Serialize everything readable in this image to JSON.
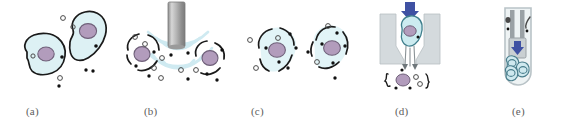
{
  "figure": {
    "background_color": "#ffffff",
    "width": 572,
    "height": 121
  },
  "palette": {
    "cytoplasm_fill": "#ddf1f4",
    "cytoplasm_fill_light": "#e8f6f8",
    "membrane_stroke": "#1a1a1a",
    "nucleus_fill": "#b29cbc",
    "nucleus_stroke": "#6f6079",
    "particle_dark": "#111111",
    "particle_open_stroke": "#4a4a4a",
    "wave_color": "#cfeaf1",
    "pipette_body": "#9a9a9a",
    "pipette_highlight": "#d8d8d8",
    "device_wall": "#c9cfd2",
    "device_wall_light": "#dfe4e6",
    "arrow_blue": "#3f51a3",
    "tube_outline": "#b9c3c7",
    "tube_fill": "#e9eef0",
    "label_color": "#5d5d5d"
  },
  "panels": [
    {
      "id": "a",
      "label": "(a)",
      "name": "panel-a-intact-cells",
      "description": "Two intact cells with membranes, nuclei and a few free particles around them",
      "cell_count": 2,
      "free_particle_count": 6
    },
    {
      "id": "b",
      "label": "(b)",
      "name": "panel-b-ultrasound-lysis",
      "description": "Ultrasonic probe emitting wave arcs that disrupt two cells releasing contents",
      "cell_count": 2,
      "has_probe": true,
      "wave_arc_count": 6
    },
    {
      "id": "c",
      "label": "(c)",
      "name": "panel-c-permeabilized-cells",
      "description": "Two cells with broken discontinuous membranes and particles leaking out",
      "cell_count": 2,
      "free_particle_count": 8
    },
    {
      "id": "d",
      "label": "(d)",
      "name": "panel-d-cell-capture-funnel",
      "description": "Cell pressed by a blue arrow into a funnel trap; contents stream out below",
      "cell_count": 1,
      "has_arrow": true
    },
    {
      "id": "e",
      "label": "(e)",
      "name": "panel-e-collection-tube",
      "description": "Collection tube containing a plunger with blue arrow and pooled cells at the bottom",
      "cell_count": 3,
      "has_arrow": true
    }
  ]
}
